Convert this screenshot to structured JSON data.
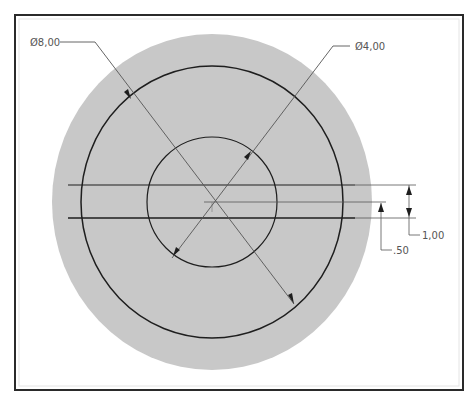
{
  "drawing": {
    "colors": {
      "frame": "#2a2a2a",
      "disk_fill": "#c8c8c8",
      "geometry_line": "#1e1e1e",
      "dimension_line": "#555555",
      "background": "#ffffff"
    },
    "dimensions": {
      "outer_diameter": "Ø8,00",
      "inner_diameter": "Ø4,00",
      "slot_width": "1,00",
      "offset": ".50"
    }
  }
}
